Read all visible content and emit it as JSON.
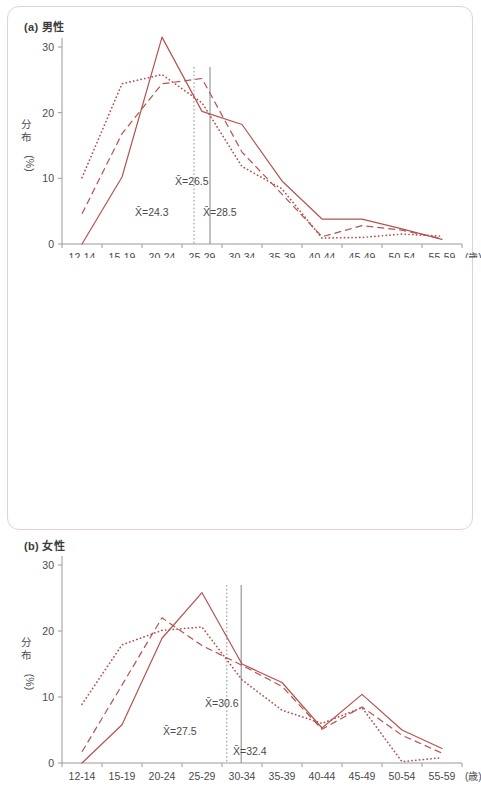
{
  "figure": {
    "line_color": "#b5534f",
    "axis_color": "#9a9a9a",
    "frame_color": "#e8cfcf",
    "ref_color": "#8e8e8e"
  },
  "panels": [
    {
      "key": "male",
      "tag": "(a)",
      "title": "男性",
      "ylabel_main": "分布",
      "ylabel_unit": "(%)",
      "xaxis_unit": "(歳)",
      "annotations": [
        {
          "name": "mean-dotted",
          "text": "X̄=26.5",
          "x": 175,
          "y": 185
        },
        {
          "name": "mean-solid",
          "text": "X̄=24.3",
          "x": 135,
          "y": 216
        },
        {
          "name": "mean-dashed",
          "text": "X̄=28.5",
          "x": 203,
          "y": 216
        }
      ],
      "reference_lines": [
        {
          "name": "ref-line-dotted",
          "value": 26.5,
          "style": "dotted"
        },
        {
          "name": "ref-line-solid",
          "value": 28.5,
          "style": "solid"
        }
      ]
    },
    {
      "key": "female",
      "tag": "(b)",
      "title": "女性",
      "ylabel_main": "分布",
      "ylabel_unit": "(%)",
      "xaxis_unit": "(歳)",
      "annotations": [
        {
          "name": "mean-dotted",
          "text": "X̄=30.6",
          "x": 205,
          "y": 442
        },
        {
          "name": "mean-solid",
          "text": "X̄=27.5",
          "x": 163,
          "y": 470
        },
        {
          "name": "mean-dashed",
          "text": "X̄=32.4",
          "x": 233,
          "y": 490
        }
      ],
      "reference_lines": [
        {
          "name": "ref-line-dotted",
          "value": 30.6,
          "style": "dotted"
        },
        {
          "name": "ref-line-solid",
          "value": 32.4,
          "style": "solid"
        }
      ]
    }
  ],
  "chart_data": [
    {
      "type": "line",
      "title": "(a) 男性",
      "xlabel": "(歳)",
      "ylabel": "分布 (%)",
      "ylim": [
        0,
        33
      ],
      "yticks": [
        0,
        10,
        20,
        30
      ],
      "grid": false,
      "legend": "none",
      "categories": [
        "12-14",
        "15-19",
        "20-24",
        "25-29",
        "30-34",
        "35-39",
        "40-44",
        "45-49",
        "50-54",
        "55-59"
      ],
      "series": [
        {
          "name": "solid",
          "linestyle": "solid",
          "values": [
            0.0,
            10.2,
            31.5,
            20.2,
            18.2,
            9.6,
            3.8,
            3.8,
            2.3,
            0.7
          ]
        },
        {
          "name": "dashed",
          "linestyle": "dashed",
          "values": [
            4.6,
            16.8,
            24.4,
            25.2,
            14.0,
            7.6,
            1.1,
            2.8,
            2.1,
            0.8
          ]
        },
        {
          "name": "dotted",
          "linestyle": "dotted",
          "values": [
            10.1,
            24.4,
            25.8,
            21.5,
            11.8,
            8.4,
            0.9,
            1.0,
            1.5,
            1.2
          ]
        }
      ],
      "annotations": [
        {
          "text": "X̄=26.5",
          "series": "dotted"
        },
        {
          "text": "X̄=24.3",
          "series": "solid"
        },
        {
          "text": "X̄=28.5",
          "series": "dashed"
        }
      ],
      "reference_lines": [
        26.5,
        28.5
      ]
    },
    {
      "type": "line",
      "title": "(b) 女性",
      "xlabel": "(歳)",
      "ylabel": "分布 (%)",
      "ylim": [
        0,
        33
      ],
      "yticks": [
        0,
        10,
        20,
        30
      ],
      "grid": false,
      "legend": "none",
      "categories": [
        "12-14",
        "15-19",
        "20-24",
        "25-29",
        "30-34",
        "35-39",
        "40-44",
        "45-49",
        "50-54",
        "55-59"
      ],
      "series": [
        {
          "name": "solid",
          "linestyle": "solid",
          "values": [
            0.0,
            5.8,
            18.9,
            25.8,
            15.0,
            12.2,
            5.3,
            10.4,
            5.0,
            2.2
          ]
        },
        {
          "name": "dashed",
          "linestyle": "dashed",
          "values": [
            1.7,
            11.8,
            22.0,
            17.8,
            14.8,
            11.6,
            5.1,
            8.5,
            4.2,
            1.5
          ]
        },
        {
          "name": "dotted",
          "linestyle": "dotted",
          "values": [
            8.9,
            17.9,
            20.1,
            20.6,
            12.6,
            8.0,
            6.0,
            8.4,
            0.2,
            0.8
          ]
        }
      ],
      "annotations": [
        {
          "text": "X̄=30.6",
          "series": "dotted"
        },
        {
          "text": "X̄=27.5",
          "series": "solid"
        },
        {
          "text": "X̄=32.4",
          "series": "dashed"
        }
      ],
      "reference_lines": [
        30.6,
        32.4
      ]
    }
  ]
}
